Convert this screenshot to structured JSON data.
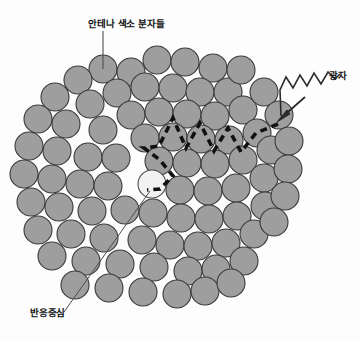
{
  "figure": {
    "background_color": "#fdfdfd",
    "width": 360,
    "height": 341
  },
  "colors": {
    "pigment_fill": "#9e9e9e",
    "pigment_stroke": "#3a3a3a",
    "reaction_center_fill": "#f2f2f2",
    "reaction_center_stroke": "#4a4a4a",
    "energy_path": "#111111",
    "photon_arrow": "#2b2b2b",
    "leader_line": "#4d4d4d",
    "label_text": "#121212"
  },
  "labels": {
    "antenna": {
      "text": "안테나 색소 분자들",
      "icon": "leader-line-vertical"
    },
    "photon": {
      "text": "광자",
      "icon": "photon-wave-arrow"
    },
    "reaction_center": {
      "text": "반응중심",
      "icon": "leader-line-diagonal"
    }
  },
  "elements": {
    "pigment_count": 73,
    "pigment_radius": 14,
    "reaction_center": {
      "cx": 152,
      "cy": 184,
      "r": 14
    },
    "photon_arrowhead": {
      "x": 277,
      "y": 122
    },
    "energy_path_style": "dashed-zigzag"
  }
}
